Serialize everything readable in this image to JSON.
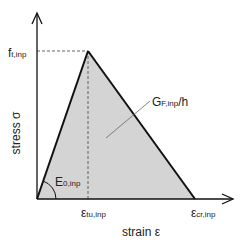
{
  "diagram": {
    "type": "tension-softening stress-strain curve",
    "axes": {
      "y_label": "stress σ",
      "x_label": "strain ε"
    },
    "labels": {
      "peak_stress": {
        "base": "f",
        "sub": "t,inp"
      },
      "peak_strain": {
        "base": "ε",
        "sub": "tu,inp"
      },
      "crack_strain": {
        "base": "ε",
        "sub": "cr,inp"
      },
      "modulus": {
        "base": "E",
        "sub": "0,inp"
      },
      "fracture_energy": {
        "base": "G",
        "sub": "F,inp",
        "suffix": "/h"
      }
    },
    "colors": {
      "fill": "#d4d4d4",
      "line": "#111111",
      "dashed": "#555555",
      "text": "#222222"
    }
  }
}
